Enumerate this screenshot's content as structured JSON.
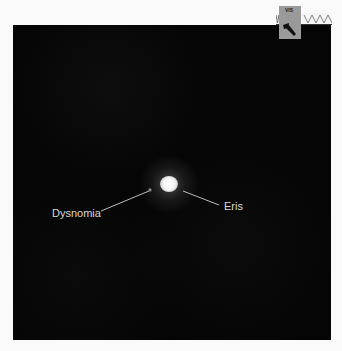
{
  "image": {
    "description": "Astronomical image of dwarf planet Eris and its moon Dysnomia on a black background",
    "background_color": "#050505",
    "labels": {
      "moon": "Dysnomia",
      "planet": "Eris"
    },
    "logo": {
      "badge_text": "VIS",
      "icon": "telescope-logo-icon"
    }
  }
}
